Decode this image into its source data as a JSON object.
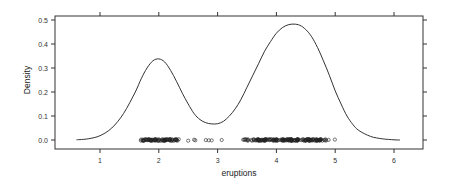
{
  "chart_data": {
    "type": "line",
    "title": "",
    "xlabel": "eruptions",
    "ylabel": "Density",
    "xlim": [
      0.55,
      6.3
    ],
    "ylim": [
      -0.02,
      0.52
    ],
    "x_ticks": [
      1,
      2,
      3,
      4,
      5,
      6
    ],
    "y_ticks": [
      0.0,
      0.1,
      0.2,
      0.3,
      0.4,
      0.5
    ],
    "y_tick_labels": [
      "0.0",
      "0.1",
      "0.2",
      "0.3",
      "0.4",
      "0.5"
    ],
    "grid": false,
    "legend": null,
    "series": [
      {
        "name": "density",
        "x": [
          0.6,
          0.8,
          1.0,
          1.2,
          1.4,
          1.6,
          1.7,
          1.8,
          1.9,
          2.0,
          2.1,
          2.2,
          2.3,
          2.4,
          2.5,
          2.6,
          2.7,
          2.8,
          2.9,
          3.0,
          3.1,
          3.2,
          3.3,
          3.4,
          3.5,
          3.6,
          3.7,
          3.8,
          3.9,
          4.0,
          4.1,
          4.2,
          4.3,
          4.4,
          4.5,
          4.6,
          4.7,
          4.8,
          4.9,
          5.0,
          5.1,
          5.2,
          5.3,
          5.4,
          5.6,
          5.8,
          6.0,
          6.1
        ],
        "y": [
          0.001,
          0.005,
          0.018,
          0.05,
          0.11,
          0.2,
          0.255,
          0.3,
          0.33,
          0.338,
          0.325,
          0.29,
          0.245,
          0.195,
          0.15,
          0.11,
          0.085,
          0.072,
          0.067,
          0.068,
          0.078,
          0.1,
          0.13,
          0.17,
          0.22,
          0.27,
          0.32,
          0.37,
          0.41,
          0.445,
          0.468,
          0.48,
          0.483,
          0.478,
          0.46,
          0.43,
          0.385,
          0.33,
          0.27,
          0.205,
          0.15,
          0.1,
          0.065,
          0.04,
          0.015,
          0.005,
          0.001,
          0.0
        ]
      }
    ],
    "rug": {
      "y": 0.0,
      "marker": "open-circle",
      "clusters": [
        {
          "from": 1.6,
          "to": 2.45,
          "count": 80
        },
        {
          "from": 3.3,
          "to": 5.1,
          "count": 170
        }
      ],
      "scattered": [
        2.5,
        2.6,
        2.62,
        2.8,
        2.85,
        2.9,
        3.07
      ]
    }
  }
}
